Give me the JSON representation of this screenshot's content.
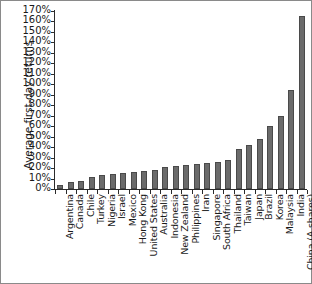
{
  "chart_data": {
    "type": "bar",
    "title": "",
    "xlabel": "",
    "ylabel": "Average first-day returns",
    "ylim": [
      0,
      170
    ],
    "ytick_suffix": "%",
    "yticks": [
      0,
      10,
      20,
      30,
      40,
      50,
      60,
      70,
      80,
      90,
      100,
      110,
      120,
      130,
      140,
      150,
      160,
      170
    ],
    "ytick_labels": [
      "0%",
      "10%",
      "20%",
      "30%",
      "40%",
      "50%",
      "60%",
      "70%",
      "80%",
      "90%",
      "100%",
      "110%",
      "120%",
      "130%",
      "140%",
      "150%",
      "160%",
      "170%"
    ],
    "grid": false,
    "legend": false,
    "bar_color": "#6b6b6b",
    "categories": [
      "Argentina",
      "Canada",
      "Chile",
      "Turkey",
      "Nigeria",
      "Israel",
      "Mexico",
      "Hong Kong",
      "United States",
      "Australia",
      "Indonesia",
      "New Zealand",
      "Philippines",
      "Iran",
      "Singapore",
      "South Africa",
      "Thailand",
      "Taiwan",
      "Japan",
      "Brazil",
      "Korea",
      "Malaysia",
      "India",
      "China (A shares)"
    ],
    "values": [
      4,
      7,
      8,
      11,
      13,
      14,
      15,
      16,
      17,
      18,
      21,
      22,
      23,
      24,
      25,
      26,
      28,
      38,
      42,
      48,
      60,
      70,
      95,
      165
    ]
  }
}
